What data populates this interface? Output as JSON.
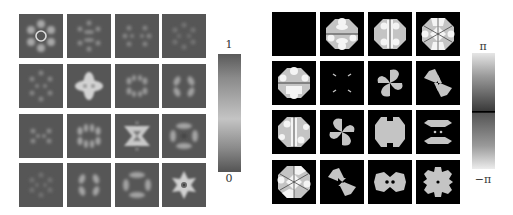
{
  "figure": {
    "left_panel": {
      "description": "4x4 grid of intensity maps",
      "colorbar": {
        "max_label": "1",
        "min_label": "0"
      },
      "colors": {
        "background": "#565656",
        "bright": "#d8d8d8"
      }
    },
    "right_panel": {
      "description": "4x4 grid of phase maps",
      "colorbar": {
        "max_label": "π",
        "min_label": "−π"
      },
      "colors": {
        "background": "#000000",
        "gray": "#c4c4c4",
        "white": "#f4f4f4"
      }
    }
  }
}
